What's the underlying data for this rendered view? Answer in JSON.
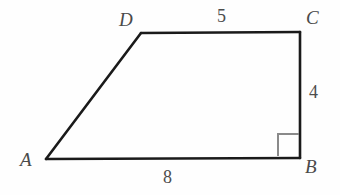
{
  "figure": {
    "kind": "right-trapezoid",
    "name": "Trapezoid ABCD",
    "background_color": "#fefefe",
    "stroke_color": "#1a1a1a",
    "right_angle_color": "#8a8a8a",
    "label_color": "#4a4a4a"
  },
  "vertices": {
    "A": {
      "label": "A",
      "x": 46,
      "y": 159
    },
    "B": {
      "label": "B",
      "x": 300,
      "y": 158
    },
    "C": {
      "label": "C",
      "x": 300,
      "y": 32
    },
    "D": {
      "label": "D",
      "x": 141,
      "y": 33
    }
  },
  "sides": {
    "AB": {
      "label": "8",
      "from": "A",
      "to": "B"
    },
    "BC": {
      "label": "4",
      "from": "B",
      "to": "C"
    },
    "CD": {
      "label": "5",
      "from": "C",
      "to": "D"
    },
    "DA": {
      "label": "",
      "from": "D",
      "to": "A"
    }
  },
  "markers": {
    "right_angle_at": "B",
    "right_angle_label": "right-angle-mark"
  },
  "chart_data": {
    "type": "diagram",
    "title": "",
    "shape": "right trapezoid ABCD",
    "labeled_lengths": {
      "AB": 8,
      "BC": 4,
      "CD": 5
    },
    "unlabeled_sides": [
      "DA"
    ],
    "right_angles": [
      "B"
    ],
    "parallel_sides": [
      "AB",
      "CD"
    ],
    "vertex_order": [
      "A",
      "B",
      "C",
      "D"
    ]
  }
}
